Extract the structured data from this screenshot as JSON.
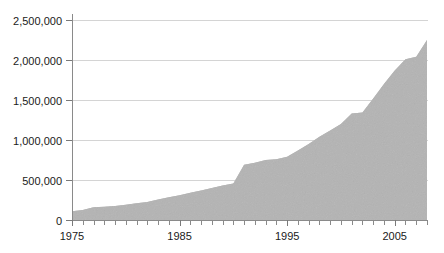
{
  "chart_data": {
    "type": "area",
    "title": "",
    "subtitle": "",
    "xlabel": "",
    "ylabel": "",
    "xlim": [
      1975,
      2008
    ],
    "ylim": [
      0,
      2500000
    ],
    "grid": true,
    "legend": false,
    "legend_position": "none",
    "y_ticks": [
      0,
      500000,
      1000000,
      1500000,
      2000000,
      2500000
    ],
    "y_tick_labels": [
      "0",
      "500,000",
      "1,000,000",
      "1,500,000",
      "2,000,000",
      "2,500,000"
    ],
    "x_ticks": [
      1975,
      1976,
      1977,
      1978,
      1979,
      1980,
      1981,
      1982,
      1983,
      1984,
      1985,
      1986,
      1987,
      1988,
      1989,
      1990,
      1991,
      1992,
      1993,
      1994,
      1995,
      1996,
      1997,
      1998,
      1999,
      2000,
      2001,
      2002,
      2003,
      2004,
      2005,
      2006,
      2007,
      2008
    ],
    "x_tick_labels": [
      "1975",
      "1985",
      "1995",
      "2005"
    ],
    "x_labeled_ticks": [
      1975,
      1985,
      1995,
      2005
    ],
    "series": [
      {
        "name": "Total",
        "x": [
          1975,
          1976,
          1977,
          1978,
          1979,
          1980,
          1981,
          1982,
          1983,
          1984,
          1985,
          1986,
          1987,
          1988,
          1989,
          1990,
          1991,
          1992,
          1993,
          1994,
          1995,
          1996,
          1997,
          1998,
          1999,
          2000,
          2001,
          2002,
          2003,
          2004,
          2005,
          2006,
          2007,
          2008
        ],
        "values": [
          110000,
          125000,
          160000,
          165000,
          175000,
          190000,
          210000,
          225000,
          255000,
          285000,
          310000,
          340000,
          370000,
          400000,
          430000,
          455000,
          690000,
          715000,
          750000,
          760000,
          790000,
          870000,
          950000,
          1040000,
          1120000,
          1200000,
          1330000,
          1345000,
          1520000,
          1700000,
          1870000,
          2010000,
          2040000,
          2250000
        ]
      }
    ],
    "colors": {
      "area_fill": "#b4b4b4",
      "gridline": "#d4d4d4",
      "axis": "#8a8a8a",
      "tick_label": "#1a1a1a",
      "background": "#ffffff"
    },
    "annotations": []
  },
  "layout": {
    "plot_left": 72,
    "plot_right": 427,
    "plot_top": 20,
    "plot_bottom": 220
  }
}
